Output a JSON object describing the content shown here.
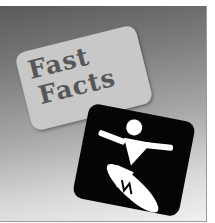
{
  "badge": {
    "title_line1": "Fast",
    "title_line2": "Facts"
  },
  "icon": {
    "name": "surfer-icon",
    "background_color": "#050505",
    "figure_color": "#ffffff"
  },
  "colors": {
    "card": "#c8c8c8",
    "card_text": "#575757",
    "gradient_top": "#5a5a5a",
    "gradient_bottom": "#f0f0f0"
  }
}
